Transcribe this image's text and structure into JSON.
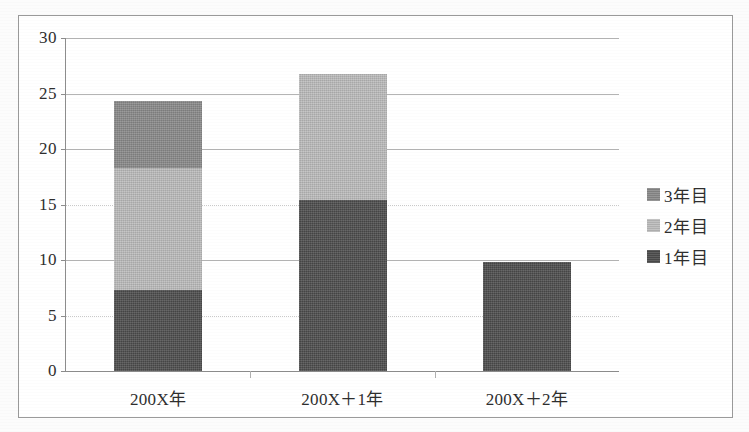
{
  "chart_data": {
    "type": "bar",
    "subtype": "stacked-bar",
    "title": "",
    "xlabel": "",
    "ylabel": "",
    "categories": [
      "200X年",
      "200X＋1年",
      "200X＋2年"
    ],
    "series": [
      {
        "name": "1年目",
        "color": "#4d4d4d",
        "values": [
          7.3,
          15.4,
          9.8
        ]
      },
      {
        "name": "2年目",
        "color": "#bcbcbc",
        "values": [
          11.0,
          11.4,
          0
        ]
      },
      {
        "name": "3年目",
        "color": "#8a8a8a",
        "values": [
          6.0,
          0,
          0
        ]
      }
    ],
    "stack_totals": [
      24.3,
      26.8,
      9.8
    ],
    "ylim": [
      0,
      30
    ],
    "yticks": [
      0,
      5,
      10,
      15,
      20,
      25,
      30
    ],
    "ytick_labels": [
      "0",
      "5",
      "10",
      "15",
      "20",
      "25",
      "30"
    ],
    "grid": true,
    "grid_axis": "y",
    "legend_position": "right",
    "legend_order": [
      "3年目",
      "2年目",
      "1年目"
    ]
  },
  "axis": {
    "ticks": [
      {
        "label": "30",
        "value": 30
      },
      {
        "label": "25",
        "value": 25
      },
      {
        "label": "20",
        "value": 20
      },
      {
        "label": "15",
        "value": 15
      },
      {
        "label": "10",
        "value": 10
      },
      {
        "label": "5",
        "value": 5
      },
      {
        "label": "0",
        "value": 0
      }
    ]
  },
  "categories": [
    {
      "label": "200X年"
    },
    {
      "label": "200X＋1年"
    },
    {
      "label": "200X＋2年"
    }
  ],
  "legend": {
    "items": [
      {
        "label": "3年目",
        "color": "#8a8a8a"
      },
      {
        "label": "2年目",
        "color": "#bcbcbc"
      },
      {
        "label": "1年目",
        "color": "#4d4d4d"
      }
    ]
  },
  "colors": {
    "year1": "#4d4d4d",
    "year2": "#bcbcbc",
    "year3": "#8a8a8a",
    "axis": "#8d8d8d",
    "grid": "#b4b4b4",
    "frame": "#9a9a9a",
    "text": "#2e2e2e"
  }
}
